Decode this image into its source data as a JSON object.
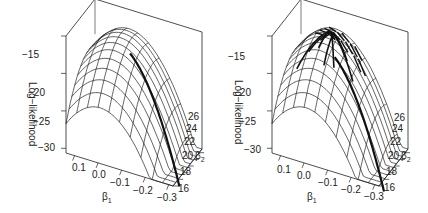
{
  "chart_data": [
    {
      "type": "surface3d",
      "title": "",
      "xlabel": "β1",
      "ylabel": "β2",
      "zlabel": "Log−likelihood",
      "x_ticks": [
        "0.1",
        "0.0",
        "−0.1",
        "−0.2",
        "−0.3"
      ],
      "y_ticks": [
        "16",
        "18",
        "20",
        "22",
        "24",
        "26"
      ],
      "z_ticks": [
        "−15",
        "−20",
        "−25",
        "−30"
      ],
      "xlim": [
        0.15,
        -0.3
      ],
      "ylim": [
        16,
        27
      ],
      "zlim": [
        -31,
        -13
      ],
      "overlay": "single optimization trace along ridge"
    },
    {
      "type": "surface3d",
      "title": "",
      "xlabel": "β1",
      "ylabel": "β2",
      "zlabel": "Log−likelihood",
      "x_ticks": [
        "0.1",
        "0.0",
        "−0.1",
        "−0.2",
        "−0.3"
      ],
      "y_ticks": [
        "16",
        "18",
        "20",
        "22",
        "24",
        "26"
      ],
      "z_ticks": [
        "−15",
        "−20",
        "−25",
        "−30"
      ],
      "xlim": [
        0.15,
        -0.3
      ],
      "ylim": [
        16,
        27
      ],
      "zlim": [
        -31,
        -13
      ],
      "overlay": "many optimization traces converging to peak"
    }
  ],
  "panels": [
    {
      "xlabel": "β",
      "xsub": "1",
      "ylabel": "β",
      "ysub": "2",
      "zlabel": "Log−likelihood",
      "x_ticks": [
        "0.1",
        "0.0",
        "−0.1",
        "−0.2",
        "−0.3"
      ],
      "y_ticks": [
        "16",
        "18",
        "20",
        "22",
        "24",
        "26"
      ],
      "z_ticks": [
        "−15",
        "−20",
        "−25",
        "−30"
      ]
    },
    {
      "xlabel": "β",
      "xsub": "1",
      "ylabel": "β",
      "ysub": "2",
      "zlabel": "Log−likelihood",
      "x_ticks": [
        "0.1",
        "0.0",
        "−0.1",
        "−0.2",
        "−0.3"
      ],
      "y_ticks": [
        "16",
        "18",
        "20",
        "22",
        "24",
        "26"
      ],
      "z_ticks": [
        "−15",
        "−20",
        "−25",
        "−30"
      ]
    }
  ]
}
